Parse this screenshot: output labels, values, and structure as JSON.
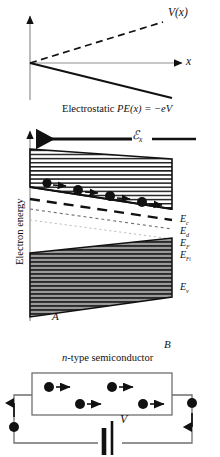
{
  "figure": {
    "domain": "physics-energy-band-diagram",
    "colors": {
      "ink": "#111111",
      "valence_fill": "#8c8c8c",
      "background": "#ffffff",
      "faint_line": "#b9b9b9"
    }
  },
  "panel_potential": {
    "curve_dashed_label": "V(x)",
    "axis_x_label": "x",
    "caption": "Electrostatic PE(x) = −eV",
    "caption_parts": {
      "prefix": "Electrostatic ",
      "pe": "PE",
      "arg": "(x) = −eV"
    }
  },
  "panel_bands": {
    "y_axis_label": "Electron energy",
    "field_arrow_label": "ℰ",
    "field_arrow_subscript": "x",
    "left_terminal_label": "A",
    "right_terminal_label": "B",
    "levels": [
      {
        "name": "conduction-band-edge",
        "symbol": "E",
        "subscript": "c"
      },
      {
        "name": "donor-level",
        "symbol": "E",
        "subscript": "d"
      },
      {
        "name": "fermi-level",
        "symbol": "E",
        "subscript": "F"
      },
      {
        "name": "intrinsic-fermi-level",
        "symbol": "E",
        "subscript": "Fi"
      },
      {
        "name": "valence-band-edge",
        "symbol": "E",
        "subscript": "v"
      }
    ],
    "carriers": {
      "type": "electron",
      "count": 4,
      "drift_direction": "right"
    }
  },
  "panel_circuit": {
    "device_label_parts": {
      "italic": "n",
      "rest": "-type semiconductor"
    },
    "device_label": "n-type semiconductor",
    "battery_label": "V",
    "internal_carrier_count": 4,
    "wire_carriers": [
      {
        "name": "left-wire-electron",
        "direction": "up"
      },
      {
        "name": "right-wire-electron",
        "direction": "down"
      }
    ]
  }
}
